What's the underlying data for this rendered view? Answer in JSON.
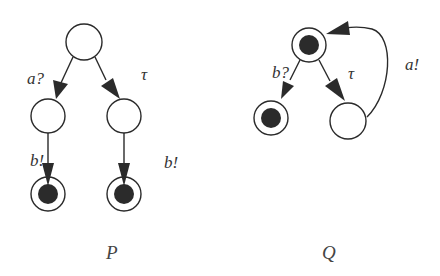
{
  "diagrams": [
    {
      "name": "P",
      "caption": "P",
      "states": [
        {
          "id": "p0",
          "type": "plain"
        },
        {
          "id": "p1",
          "type": "plain"
        },
        {
          "id": "p2",
          "type": "plain"
        },
        {
          "id": "p3",
          "type": "accepting"
        },
        {
          "id": "p4",
          "type": "accepting"
        }
      ],
      "transitions": [
        {
          "from": "p0",
          "to": "p1",
          "label": "a?"
        },
        {
          "from": "p0",
          "to": "p2",
          "label": "τ"
        },
        {
          "from": "p1",
          "to": "p3",
          "label": "b!"
        },
        {
          "from": "p2",
          "to": "p4",
          "label": "b!"
        }
      ]
    },
    {
      "name": "Q",
      "caption": "Q",
      "states": [
        {
          "id": "q0",
          "type": "accepting"
        },
        {
          "id": "q1",
          "type": "accepting"
        },
        {
          "id": "q2",
          "type": "plain"
        }
      ],
      "transitions": [
        {
          "from": "q0",
          "to": "q1",
          "label": "b?"
        },
        {
          "from": "q0",
          "to": "q2",
          "label": "τ"
        },
        {
          "from": "q2",
          "to": "q0",
          "label": "a!"
        }
      ]
    }
  ],
  "colors": {
    "stroke": "#2a2a2a",
    "fill_accepting": "#2b2b2b",
    "text": "#333333"
  }
}
